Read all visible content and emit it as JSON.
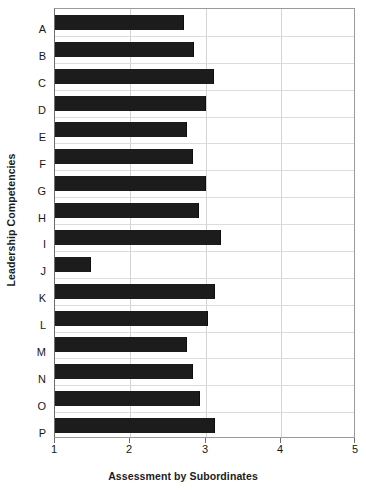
{
  "chart_data": {
    "type": "bar",
    "orientation": "horizontal",
    "title": "",
    "xlabel": "Assessment by Subordinates",
    "ylabel": "Leadership Competencies",
    "categories": [
      "A",
      "B",
      "C",
      "D",
      "E",
      "F",
      "G",
      "H",
      "I",
      "J",
      "K",
      "L",
      "M",
      "N",
      "O",
      "P"
    ],
    "values": [
      2.72,
      2.85,
      3.11,
      3.0,
      2.75,
      2.83,
      3.01,
      2.92,
      3.21,
      1.48,
      3.12,
      3.03,
      2.75,
      2.84,
      2.93,
      3.13
    ],
    "xlim": [
      1,
      5
    ],
    "xticks": [
      1,
      2,
      3,
      4,
      5
    ],
    "xtick_labels": [
      "1",
      "2",
      "3",
      "4",
      "5"
    ],
    "grid": "vertical-and-horizontal",
    "legend": "none",
    "bar_color": "#1c1c1c",
    "grid_color": "#d3d3d3",
    "axis_color": "#6e6e6e"
  }
}
